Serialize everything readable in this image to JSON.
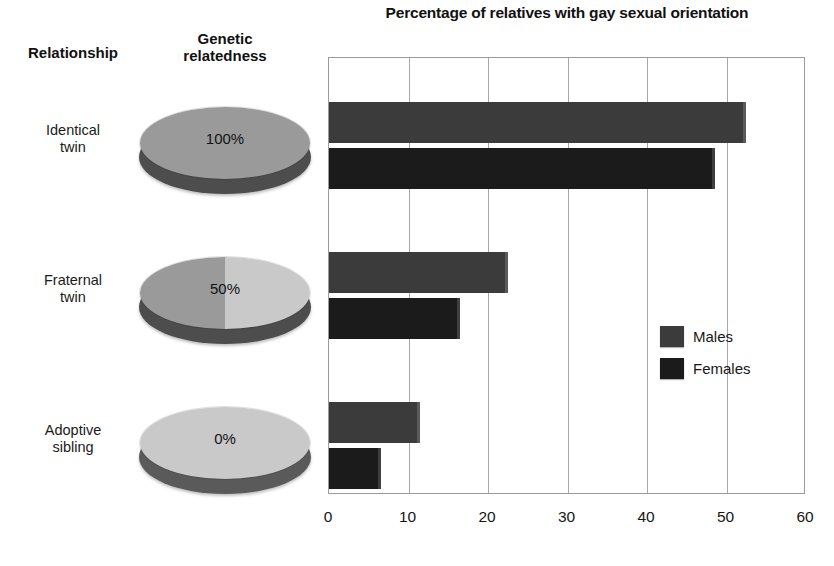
{
  "chart_data": {
    "type": "bar",
    "orientation": "horizontal",
    "title": "Percentage of relatives with gay sexual orientation",
    "xlabel": "",
    "ylabel": "",
    "xlim": [
      0,
      60
    ],
    "xticks": [
      0,
      10,
      20,
      30,
      40,
      50,
      60
    ],
    "grid": true,
    "legend_position": "right-middle",
    "categories": [
      "Identical twin",
      "Fraternal twin",
      "Adoptive sibling"
    ],
    "series": [
      {
        "name": "Males",
        "color": "#3b3b3b",
        "values": [
          52.5,
          22.5,
          11.5
        ]
      },
      {
        "name": "Females",
        "color": "#1b1b1b",
        "values": [
          48.5,
          16.5,
          6.5
        ]
      }
    ]
  },
  "title": "Percentage of relatives with gay sexual orientation",
  "columns": {
    "relationship_header": "Relationship",
    "genetic_header_line1": "Genetic",
    "genetic_header_line2": "relatedness"
  },
  "rows": [
    {
      "relationship_line1": "Identical",
      "relationship_line2": "twin",
      "relatedness": "100%",
      "pie_left_color": "#9a9a9a",
      "pie_right_color": "#9a9a9a"
    },
    {
      "relationship_line1": "Fraternal",
      "relationship_line2": "twin",
      "relatedness": "50%",
      "pie_left_color": "#9a9a9a",
      "pie_right_color": "#c9c9c9"
    },
    {
      "relationship_line1": "Adoptive",
      "relationship_line2": "sibling",
      "relatedness": "0%",
      "pie_left_color": "#c9c9c9",
      "pie_right_color": "#c9c9c9"
    }
  ],
  "legend": {
    "items": [
      {
        "label": "Males",
        "color": "#3b3b3b"
      },
      {
        "label": "Females",
        "color": "#1b1b1b"
      }
    ]
  },
  "xaxis": {
    "ticks": [
      "0",
      "10",
      "20",
      "30",
      "40",
      "50",
      "60"
    ]
  }
}
